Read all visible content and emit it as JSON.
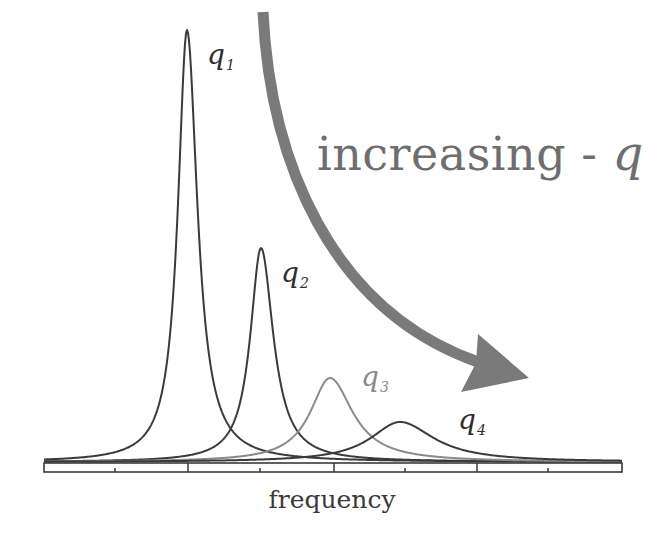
{
  "chart_data": {
    "type": "line",
    "title": "",
    "annotation": {
      "text": "increasing - ",
      "symbol": "q",
      "arrow": "curved arrow pointing from upper-left down to lower-right, indicating peaks shift right and broaden as q increases",
      "color": "#7a7a7a"
    },
    "xlabel": "frequency",
    "ylabel": "",
    "grid": false,
    "legend": "inline labels next to each peak",
    "axis": {
      "x_ticks_major_px": [
        188,
        334,
        477
      ],
      "x_ticks_minor_px": [
        115,
        260,
        405,
        548
      ],
      "tick_labels": [],
      "x_range_px": [
        44,
        622
      ]
    },
    "series": [
      {
        "name": "q1",
        "label_main": "q",
        "label_sub": "1",
        "peak_x_px": 187,
        "peak_y_px": 30,
        "half_width_px": 22,
        "color": "#3a3a3a",
        "relative_height": 1.0
      },
      {
        "name": "q2",
        "label_main": "q",
        "label_sub": "2",
        "peak_x_px": 261,
        "peak_y_px": 248,
        "half_width_px": 26,
        "color": "#3a3a3a",
        "relative_height": 0.49
      },
      {
        "name": "q3",
        "label_main": "q",
        "label_sub": "3",
        "peak_x_px": 330,
        "peak_y_px": 378,
        "half_width_px": 48,
        "color": "#8a8a8a",
        "relative_height": 0.19
      },
      {
        "name": "q4",
        "label_main": "q",
        "label_sub": "4",
        "peak_x_px": 400,
        "peak_y_px": 422,
        "half_width_px": 72,
        "color": "#3a3a3a",
        "relative_height": 0.09
      }
    ],
    "baseline_y_px": 462
  },
  "labels": {
    "q1": {
      "main": "q",
      "sub": "1"
    },
    "q2": {
      "main": "q",
      "sub": "2"
    },
    "q3": {
      "main": "q",
      "sub": "3"
    },
    "q4": {
      "main": "q",
      "sub": "4"
    }
  },
  "annotation": {
    "text": "increasing - ",
    "symbol": "q"
  },
  "xlabel": "frequency",
  "colors": {
    "curve_dark": "#3a3a3a",
    "curve_light": "#8a8a8a",
    "arrow": "#7a7a7a",
    "annotation_text": "#6e6e6e",
    "axis": "#3a3a3a"
  }
}
